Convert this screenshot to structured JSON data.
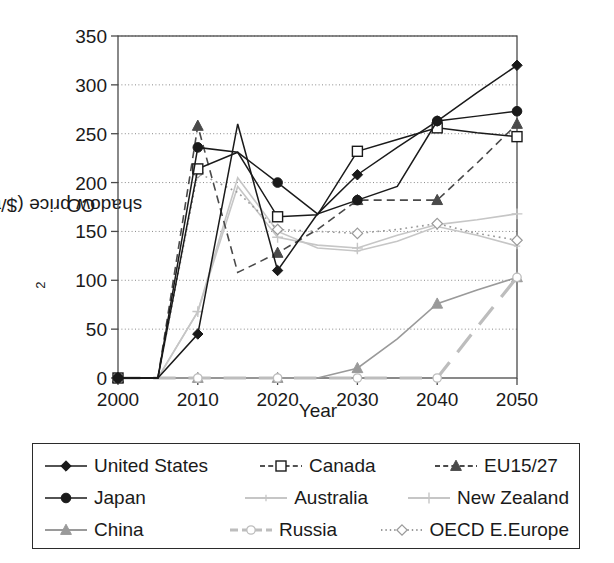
{
  "chart": {
    "type": "line",
    "title": "",
    "xlabel": "Year",
    "ylabel_main": "CO",
    "ylabel_sub": "2",
    "ylabel_rest": " shadow price ($/tC)",
    "ylabel_full": "CO2 shadow price ($/tC)",
    "xlim": [
      2000,
      2050
    ],
    "ylim": [
      0,
      350
    ],
    "xticks": [
      "2000",
      "2010",
      "2020",
      "2030",
      "2040",
      "2050"
    ],
    "xtick_values": [
      2000,
      2010,
      2020,
      2030,
      2040,
      2050
    ],
    "yticks": [
      "0",
      "50",
      "100",
      "150",
      "200",
      "250",
      "300",
      "350"
    ],
    "ytick_values": [
      0,
      50,
      100,
      150,
      200,
      250,
      300,
      350
    ],
    "grid": "horizontal-dotted",
    "legend_position": "below-plot-boxed"
  },
  "chart_data": {
    "type": "line",
    "title": "",
    "xlabel": "Year",
    "ylabel": "CO2 shadow price ($/tC)",
    "xlim": [
      2000,
      2050
    ],
    "ylim": [
      0,
      350
    ],
    "grid": true,
    "legend_position": "bottom",
    "x": [
      2000,
      2005,
      2010,
      2015,
      2020,
      2025,
      2030,
      2035,
      2040,
      2045,
      2050
    ],
    "series": [
      {
        "name": "United States",
        "marker": "filled-diamond",
        "color": "#1a1a1a",
        "dash": "solid",
        "values": [
          0,
          0,
          45,
          260,
          110,
          168,
          208,
          236,
          263,
          292,
          320
        ]
      },
      {
        "name": "Canada",
        "marker": "open-square",
        "color": "#1a1a1a",
        "dash": "solid",
        "values": [
          0,
          0,
          214,
          231,
          165,
          167,
          232,
          244,
          256,
          251,
          247
        ]
      },
      {
        "name": "EU15/27",
        "marker": "filled-triangle",
        "color": "#4a4a4a",
        "dash": "dashed",
        "values": [
          0,
          0,
          258,
          108,
          128,
          152,
          182,
          182,
          182,
          220,
          260
        ]
      },
      {
        "name": "Japan",
        "marker": "filled-circle",
        "color": "#1a1a1a",
        "dash": "solid",
        "values": [
          0,
          0,
          236,
          231,
          200,
          168,
          182,
          196,
          263,
          268,
          273
        ]
      },
      {
        "name": "Australia",
        "marker": "small-plus",
        "color": "#c6c6c6",
        "dash": "solid",
        "values": [
          0,
          0,
          68,
          205,
          150,
          133,
          130,
          140,
          155,
          146,
          135
        ]
      },
      {
        "name": "New Zealand",
        "marker": "plus",
        "color": "#c6c6c6",
        "dash": "solid",
        "values": [
          0,
          0,
          68,
          196,
          144,
          136,
          133,
          146,
          157,
          162,
          168
        ]
      },
      {
        "name": "China",
        "marker": "filled-triangle",
        "color": "#9a9a9a",
        "dash": "solid",
        "values": [
          0,
          0,
          0,
          0,
          0,
          0,
          10,
          40,
          76,
          90,
          103
        ]
      },
      {
        "name": "Russia",
        "marker": "open-circle",
        "color": "#bdbdbd",
        "dash": "long-dash",
        "values": [
          0,
          0,
          0,
          0,
          0,
          0,
          0,
          0,
          0,
          52,
          103
        ]
      },
      {
        "name": "OECD E.Europe",
        "marker": "open-diamond",
        "color": "#9a9a9a",
        "dash": "dotted",
        "values": [
          0,
          0,
          210,
          190,
          152,
          150,
          148,
          152,
          158,
          148,
          141
        ]
      }
    ]
  },
  "legend": {
    "rows": [
      [
        {
          "label": "United States",
          "sym": "filled-diamond-line",
          "color": "#1a1a1a"
        },
        {
          "label": "Canada",
          "sym": "open-square-dash",
          "color": "#1a1a1a"
        },
        {
          "label": "EU15/27",
          "sym": "filled-triangle-dash",
          "color": "#4a4a4a"
        }
      ],
      [
        {
          "label": "Japan",
          "sym": "filled-circle-line",
          "color": "#1a1a1a"
        },
        {
          "label": "Australia",
          "sym": "small-plus-line",
          "color": "#c6c6c6"
        },
        {
          "label": "New Zealand",
          "sym": "plus-line",
          "color": "#c6c6c6"
        }
      ],
      [
        {
          "label": "China",
          "sym": "filled-triangle-line",
          "color": "#9a9a9a"
        },
        {
          "label": "Russia",
          "sym": "open-circle-longdash",
          "color": "#bdbdbd"
        },
        {
          "label": "OECD E.Europe",
          "sym": "open-diamond-dotted",
          "color": "#9a9a9a"
        }
      ]
    ]
  }
}
